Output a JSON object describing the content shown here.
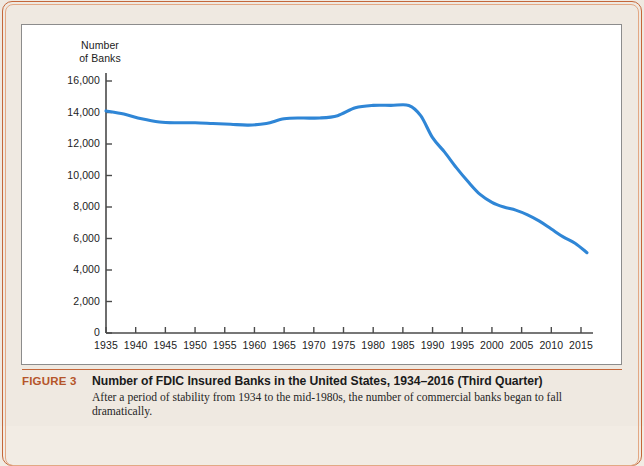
{
  "figure": {
    "tag": "FIGURE 3",
    "title": "Number of FDIC Insured Banks in the United States, 1934–2016 (Third Quarter)",
    "body": "After a period of stability from 1934 to the mid-1980s, the number of commercial banks began to fall dramatically."
  },
  "colors": {
    "line": "#2f86d6",
    "accent": "#b5552a",
    "page_bg": "#efe9e1",
    "panel_bg": "#ffffff",
    "axis": "#4a4a4a"
  },
  "chart_data": {
    "type": "line",
    "title": "Number of FDIC Insured Banks in the United States, 1934–2016 (Third Quarter)",
    "xlabel": "",
    "ylabel": "Number of Banks",
    "ylabel_lines": [
      "Number",
      "of Banks"
    ],
    "grid": false,
    "legend": false,
    "xlim": [
      1935,
      2016
    ],
    "ylim": [
      0,
      16000
    ],
    "yticks": [
      0,
      2000,
      4000,
      6000,
      8000,
      10000,
      12000,
      14000,
      16000
    ],
    "ytick_labels": [
      "0",
      "2,000",
      "4,000",
      "6,000",
      "8,000",
      "10,000",
      "12,000",
      "14,000",
      "16,000"
    ],
    "xticks": [
      1935,
      1940,
      1945,
      1950,
      1955,
      1960,
      1965,
      1970,
      1975,
      1980,
      1985,
      1990,
      1995,
      2000,
      2005,
      2010,
      2015
    ],
    "xtick_labels": [
      "1935",
      "1940",
      "1945",
      "1950",
      "1955",
      "1960",
      "1965",
      "1970",
      "1975",
      "1980",
      "1985",
      "1990",
      "1995",
      "2000",
      "2005",
      "2010",
      "2015"
    ],
    "series": [
      {
        "name": "FDIC Insured Banks",
        "color": "#2f86d6",
        "x": [
          1935,
          1938,
          1941,
          1944,
          1947,
          1950,
          1953,
          1956,
          1959,
          1962,
          1965,
          1968,
          1971,
          1974,
          1977,
          1980,
          1983,
          1986,
          1988,
          1990,
          1992,
          1994,
          1996,
          1998,
          2000,
          2002,
          2004,
          2006,
          2008,
          2010,
          2012,
          2014,
          2016
        ],
        "y": [
          14100,
          13900,
          13600,
          13400,
          13350,
          13350,
          13300,
          13250,
          13200,
          13300,
          13600,
          13650,
          13650,
          13800,
          14300,
          14450,
          14450,
          14450,
          13800,
          12400,
          11500,
          10500,
          9600,
          8800,
          8300,
          8000,
          7800,
          7500,
          7100,
          6600,
          6100,
          5700,
          5100
        ]
      }
    ],
    "annotation": "Line declines sharply after the mid-1980s peak of about 14,500 banks to roughly 5,100 in 2016."
  }
}
